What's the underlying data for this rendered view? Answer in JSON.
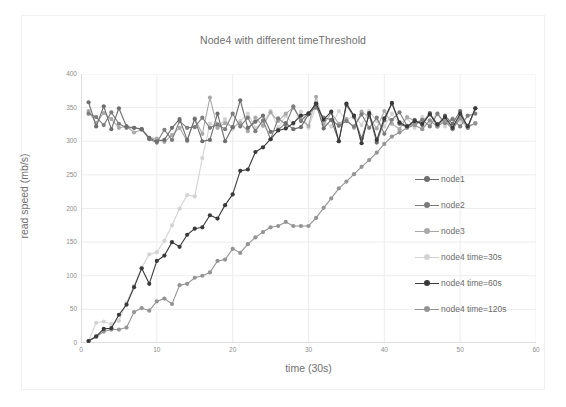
{
  "chart_data": {
    "type": "line",
    "title": "Node4 with different timeThreshold",
    "xlabel": "time (30s)",
    "ylabel": "read speed (mb/s)",
    "xlim": [
      0,
      60
    ],
    "ylim": [
      0,
      400
    ],
    "xticks": [
      0,
      10,
      20,
      30,
      40,
      50,
      60
    ],
    "yticks": [
      0,
      50,
      100,
      150,
      200,
      250,
      300,
      350,
      400
    ],
    "grid": true,
    "legend_position": "right-inside",
    "x": [
      1,
      2,
      3,
      4,
      5,
      6,
      7,
      8,
      9,
      10,
      11,
      12,
      13,
      14,
      15,
      16,
      17,
      18,
      19,
      20,
      21,
      22,
      23,
      24,
      25,
      26,
      27,
      28,
      29,
      30,
      31,
      32,
      33,
      34,
      35,
      36,
      37,
      38,
      39,
      40,
      41,
      42,
      43,
      44,
      45,
      46,
      47,
      48,
      49,
      50,
      51,
      52
    ],
    "series": [
      {
        "name": "node1",
        "color": "#6e6e6e",
        "values": [
          358,
          322,
          352,
          318,
          349,
          322,
          320,
          318,
          305,
          300,
          302,
          320,
          333,
          302,
          333,
          300,
          302,
          341,
          300,
          321,
          361,
          320,
          329,
          338,
          314,
          317,
          327,
          318,
          321,
          340,
          356,
          319,
          332,
          300,
          354,
          336,
          304,
          340,
          298,
          331,
          356,
          326,
          321,
          332,
          324,
          342,
          322,
          338,
          326,
          345,
          320,
          349
        ]
      },
      {
        "name": "node2",
        "color": "#7d7d7d",
        "values": [
          341,
          336,
          324,
          343,
          326,
          320,
          320,
          318,
          303,
          298,
          317,
          302,
          330,
          320,
          321,
          335,
          320,
          325,
          318,
          341,
          322,
          335,
          315,
          331,
          303,
          334,
          325,
          352,
          330,
          342,
          350,
          335,
          332,
          323,
          330,
          322,
          340,
          320,
          335,
          311,
          332,
          343,
          323,
          325,
          332,
          322,
          341,
          327,
          333,
          322,
          338,
          341
        ]
      },
      {
        "name": "node3",
        "color": "#a9a9a9",
        "values": [
          345,
          327,
          342,
          333,
          320,
          322,
          313,
          317,
          305,
          304,
          299,
          309,
          320,
          300,
          334,
          311,
          365,
          320,
          327,
          321,
          327,
          315,
          335,
          323,
          343,
          330,
          341,
          350,
          332,
          323,
          366,
          325,
          342,
          326,
          333,
          320,
          344,
          336,
          319,
          345,
          326,
          318,
          336,
          330,
          329,
          341,
          325,
          332,
          318,
          336,
          323,
          326
        ]
      },
      {
        "name": "node4 time=30s",
        "color": "#d3d3d3",
        "values": [
          3,
          30,
          32,
          28,
          33,
          60,
          85,
          112,
          132,
          135,
          152,
          175,
          200,
          220,
          218,
          275,
          326,
          320,
          333,
          318,
          330,
          341,
          320,
          328,
          345,
          320,
          338,
          325,
          344,
          320,
          352,
          330,
          322,
          345,
          331,
          338,
          324,
          345,
          330,
          322,
          341,
          326,
          334,
          320,
          336,
          328,
          341,
          322,
          334,
          330,
          320,
          327
        ]
      },
      {
        "name": "node4 time=60s",
        "color": "#3a3a3a",
        "values": [
          3,
          10,
          21,
          22,
          42,
          57,
          83,
          111,
          88,
          122,
          130,
          150,
          143,
          161,
          170,
          172,
          190,
          185,
          205,
          221,
          256,
          258,
          284,
          291,
          303,
          316,
          319,
          327,
          338,
          341,
          356,
          332,
          344,
          300,
          356,
          338,
          297,
          342,
          302,
          334,
          357,
          328,
          322,
          330,
          326,
          340,
          325,
          336,
          320,
          341,
          322,
          349
        ]
      },
      {
        "name": "node4 time=120s",
        "color": "#949494",
        "values": [
          3,
          9,
          17,
          20,
          20,
          23,
          46,
          52,
          48,
          62,
          66,
          58,
          86,
          88,
          97,
          100,
          105,
          122,
          124,
          140,
          134,
          147,
          157,
          165,
          172,
          174,
          180,
          174,
          174,
          174,
          186,
          201,
          215,
          230,
          240,
          251,
          262,
          272,
          283,
          296,
          307,
          313,
          320,
          324,
          318,
          331,
          322,
          330,
          318,
          334,
          321,
          327
        ]
      }
    ]
  },
  "axes": {
    "y_tick_labels": [
      "400",
      "350",
      "300",
      "250",
      "200",
      "150",
      "100",
      "50",
      "0"
    ],
    "x_tick_labels": [
      "0",
      "10",
      "20",
      "30",
      "40",
      "50",
      "60"
    ]
  },
  "legend": {
    "items": [
      {
        "label": "node1",
        "color": "#6e6e6e",
        "marker": "circle"
      },
      {
        "label": "node2",
        "color": "#7d7d7d",
        "marker": "circle"
      },
      {
        "label": "node3",
        "color": "#a9a9a9",
        "marker": "circle"
      },
      {
        "label": "node4 time=30s",
        "color": "#d3d3d3",
        "marker": "circle"
      },
      {
        "label": "node4 time=60s",
        "color": "#3a3a3a",
        "marker": "circle"
      },
      {
        "label": "node4 time=120s",
        "color": "#949494",
        "marker": "circle"
      }
    ]
  }
}
